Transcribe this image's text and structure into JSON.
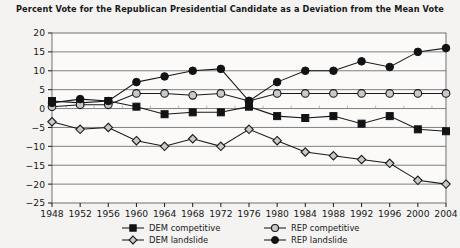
{
  "chart_data": {
    "type": "line",
    "title": "Percent Vote for the Republican Presidential Candidate as a Deviation from the Mean Vote",
    "xlabel": "",
    "ylabel": "",
    "x": [
      1948,
      1952,
      1956,
      1960,
      1964,
      1968,
      1972,
      1976,
      1980,
      1984,
      1988,
      1992,
      1996,
      2000,
      2004
    ],
    "categories": [
      "1948",
      "1952",
      "1956",
      "1960",
      "1964",
      "1968",
      "1972",
      "1976",
      "1980",
      "1984",
      "1988",
      "1992",
      "1996",
      "2000",
      "2004"
    ],
    "xlim": [
      1948,
      2004
    ],
    "ylim": [
      -25,
      20
    ],
    "yticks": [
      -25,
      -20,
      -15,
      -10,
      -5,
      0,
      5,
      10,
      15,
      20
    ],
    "ytick_labels": [
      "−25",
      "−20",
      "−15",
      "−10",
      "−5",
      "0",
      "5",
      "10",
      "15",
      "20"
    ],
    "grid": true,
    "legend_position": "bottom",
    "series": [
      {
        "name": "DEM competitive",
        "marker": "filled-square",
        "values": [
          2.0,
          1.5,
          2.0,
          0.5,
          -1.5,
          -1.0,
          -1.0,
          0.5,
          -2.0,
          -2.5,
          -2.0,
          -4.0,
          -2.0,
          -5.5,
          -6.0
        ]
      },
      {
        "name": "REP competitive",
        "marker": "open-circle",
        "values": [
          0.5,
          1.0,
          1.0,
          4.0,
          4.0,
          3.5,
          4.0,
          2.0,
          4.0,
          4.0,
          4.0,
          4.0,
          4.0,
          4.0,
          4.0
        ]
      },
      {
        "name": "DEM landslide",
        "marker": "open-diamond",
        "values": [
          -3.5,
          -5.5,
          -5.0,
          -8.5,
          -10.0,
          -8.0,
          -10.0,
          -5.5,
          -8.5,
          -11.5,
          -12.5,
          -13.5,
          -14.5,
          -19.0,
          -20.0
        ]
      },
      {
        "name": "REP landslide",
        "marker": "filled-circle",
        "values": [
          1.5,
          2.5,
          2.0,
          7.0,
          8.5,
          10.0,
          10.5,
          2.0,
          7.0,
          10.0,
          10.0,
          12.5,
          11.0,
          15.0,
          16.0
        ]
      }
    ]
  },
  "legend": {
    "items": [
      {
        "label": "DEM competitive",
        "marker": "filled-square"
      },
      {
        "label": "REP competitive",
        "marker": "open-circle"
      },
      {
        "label": "DEM landslide",
        "marker": "open-diamond"
      },
      {
        "label": "REP landslide",
        "marker": "filled-circle"
      }
    ]
  },
  "colors": {
    "ink": "#16181a",
    "marker_fill_dark": "#111315",
    "marker_fill_light": "#c9c9c9",
    "grid": "#6f7174",
    "background": "#f4f3f1"
  }
}
